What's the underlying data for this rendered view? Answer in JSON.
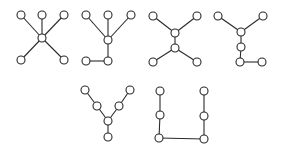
{
  "diagram": {
    "type": "tree-graphs",
    "node_radius": 4,
    "graphs": [
      {
        "name": "star-k1-5",
        "nodes": [
          [
            42,
            38
          ],
          [
            21,
            15
          ],
          [
            42,
            15
          ],
          [
            64,
            15
          ],
          [
            21,
            60
          ],
          [
            64,
            60
          ]
        ],
        "edges": [
          [
            0,
            1
          ],
          [
            0,
            2
          ],
          [
            0,
            3
          ],
          [
            0,
            4
          ],
          [
            0,
            5
          ]
        ]
      },
      {
        "name": "spider-with-bent-leg",
        "nodes": [
          [
            108,
            40
          ],
          [
            86,
            15
          ],
          [
            108,
            15
          ],
          [
            131,
            15
          ],
          [
            108,
            61
          ],
          [
            86,
            61
          ]
        ],
        "edges": [
          [
            0,
            1
          ],
          [
            0,
            2
          ],
          [
            0,
            3
          ],
          [
            0,
            4
          ],
          [
            4,
            5
          ]
        ]
      },
      {
        "name": "double-star-h",
        "nodes": [
          [
            153,
            16
          ],
          [
            197,
            16
          ],
          [
            175,
            33
          ],
          [
            175,
            48
          ],
          [
            153,
            62
          ],
          [
            197,
            62
          ]
        ],
        "edges": [
          [
            0,
            2
          ],
          [
            1,
            2
          ],
          [
            2,
            3
          ],
          [
            3,
            4
          ],
          [
            3,
            5
          ]
        ]
      },
      {
        "name": "fork-with-tail",
        "nodes": [
          [
            218,
            16
          ],
          [
            263,
            16
          ],
          [
            241,
            32
          ],
          [
            241,
            47
          ],
          [
            240,
            62
          ],
          [
            262,
            62
          ]
        ],
        "edges": [
          [
            0,
            2
          ],
          [
            1,
            2
          ],
          [
            2,
            3
          ],
          [
            3,
            4
          ],
          [
            4,
            5
          ]
        ]
      },
      {
        "name": "y-shape",
        "nodes": [
          [
            85,
            90
          ],
          [
            97,
            106
          ],
          [
            108,
            121
          ],
          [
            119,
            106
          ],
          [
            130,
            90
          ],
          [
            108,
            137
          ]
        ],
        "edges": [
          [
            0,
            1
          ],
          [
            1,
            2
          ],
          [
            2,
            3
          ],
          [
            3,
            4
          ],
          [
            2,
            5
          ]
        ]
      },
      {
        "name": "u-path",
        "nodes": [
          [
            160,
            91
          ],
          [
            160,
            115
          ],
          [
            159,
            138
          ],
          [
            204,
            139
          ],
          [
            204,
            116
          ],
          [
            204,
            91
          ]
        ],
        "edges": [
          [
            0,
            1
          ],
          [
            1,
            2
          ],
          [
            2,
            3
          ],
          [
            3,
            4
          ],
          [
            4,
            5
          ]
        ]
      }
    ]
  }
}
